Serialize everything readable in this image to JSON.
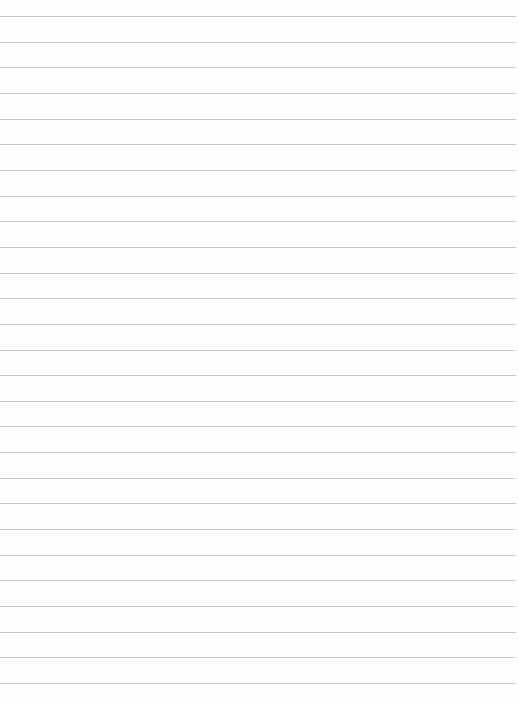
{
  "document": {
    "type": "lined-paper",
    "ruled_line_count": 27,
    "line_color": "#c4c4c4",
    "paper_color": "#fefefe",
    "text_content": []
  }
}
